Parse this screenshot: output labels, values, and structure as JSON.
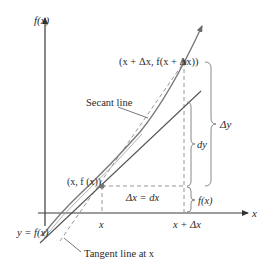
{
  "diagram": {
    "type": "differential-vs-increment",
    "axes": {
      "y_label": "f(x)",
      "x_label": "x"
    },
    "points": {
      "base_point_label": "(x, f (x))",
      "secant_point_label": "(x + Δx, f(x + Δx))"
    },
    "curve_label": "y = f(x)",
    "line_labels": {
      "secant": "Secant line",
      "tangent": "Tangent line at x"
    },
    "ticks": {
      "x": "x",
      "x_plus_dx": "x + Δx"
    },
    "interval_labels": {
      "delta_x": "Δx = dx",
      "dy": "dy",
      "delta_y": "Δy",
      "fx": "f(x)"
    },
    "colors": {
      "axis": "#3a3a3a",
      "curve": "#7a7a7a",
      "tangent": "#555555",
      "secant": "#8a8a8a",
      "dashed": "#8a8a8a",
      "brace": "#7a7a7a",
      "text": "#2a2a2a"
    }
  }
}
